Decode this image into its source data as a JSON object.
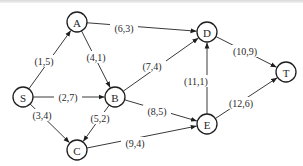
{
  "diagram": {
    "type": "directed-network",
    "node_radius": 10,
    "nodes": [
      {
        "id": "S",
        "label": "S",
        "x": 23,
        "y": 97
      },
      {
        "id": "A",
        "label": "A",
        "x": 77,
        "y": 22
      },
      {
        "id": "B",
        "label": "B",
        "x": 115,
        "y": 97
      },
      {
        "id": "C",
        "label": "C",
        "x": 77,
        "y": 150
      },
      {
        "id": "D",
        "label": "D",
        "x": 207,
        "y": 32
      },
      {
        "id": "E",
        "label": "E",
        "x": 207,
        "y": 124
      },
      {
        "id": "T",
        "label": "T",
        "x": 286,
        "y": 72
      }
    ],
    "edges": [
      {
        "from": "S",
        "to": "A",
        "label": "(1,5)",
        "lx": 44,
        "ly": 61
      },
      {
        "from": "S",
        "to": "B",
        "label": "(2,7)",
        "lx": 68,
        "ly": 97
      },
      {
        "from": "S",
        "to": "C",
        "label": "(3,4)",
        "lx": 42,
        "ly": 115
      },
      {
        "from": "A",
        "to": "D",
        "label": "(6,3)",
        "lx": 124,
        "ly": 28
      },
      {
        "from": "A",
        "to": "B",
        "label": "(4,1)",
        "lx": 96,
        "ly": 57
      },
      {
        "from": "B",
        "to": "D",
        "label": "(7,4)",
        "lx": 152,
        "ly": 66
      },
      {
        "from": "B",
        "to": "C",
        "label": "(5,2)",
        "lx": 100,
        "ly": 118
      },
      {
        "from": "B",
        "to": "E",
        "label": "(8,5)",
        "lx": 157,
        "ly": 111
      },
      {
        "from": "C",
        "to": "E",
        "label": "(9,4)",
        "lx": 135,
        "ly": 143
      },
      {
        "from": "E",
        "to": "D",
        "label": "(11,1)",
        "lx": 196,
        "ly": 81
      },
      {
        "from": "D",
        "to": "T",
        "label": "(10,9)",
        "lx": 245,
        "ly": 51
      },
      {
        "from": "E",
        "to": "T",
        "label": "(12,6)",
        "lx": 241,
        "ly": 103
      }
    ],
    "colors": {
      "stroke": "#1e1e1e",
      "edge": "#3a3a3a",
      "background": "#ffffff"
    }
  }
}
